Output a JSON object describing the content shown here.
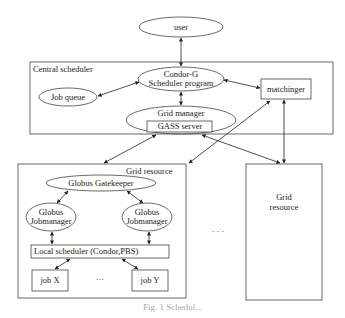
{
  "diagram": {
    "nodes": {
      "user": "user",
      "central_scheduler": "Central scheduler",
      "condor_g_line1": "Condor-G",
      "condor_g_line2": "Scheduler program",
      "job_queue": "Job queue",
      "matchinger": "matchinger",
      "grid_manager": "Grid manager",
      "gass_server": "GASS  server",
      "grid_resource_main": "Grid resource",
      "globus_gatekeeper": "Globus Gatekeeper",
      "jobmanager_left_line1": "Globus",
      "jobmanager_left_line2": "Jobmanager",
      "jobmanager_right_line1": "Globus",
      "jobmanager_right_line2": "Jobmanager",
      "local_scheduler": "Local scheduler (Condor,PBS)",
      "job_x": "job X",
      "job_y": "job Y",
      "job_ellipsis": "···",
      "grid_resource_other_line1": "Grid",
      "grid_resource_other_line2": "resource",
      "resources_ellipsis": "· · ·"
    },
    "edges": [
      {
        "from": "user",
        "to": "Condor-G Scheduler program",
        "type": "bidirectional"
      },
      {
        "from": "Job queue",
        "to": "Condor-G Scheduler program",
        "type": "bidirectional"
      },
      {
        "from": "Condor-G Scheduler program",
        "to": "matchinger",
        "type": "bidirectional"
      },
      {
        "from": "Condor-G Scheduler program",
        "to": "Grid manager",
        "type": "bidirectional"
      },
      {
        "from": "GASS server",
        "to": "Grid resource (left)",
        "type": "bidirectional"
      },
      {
        "from": "matchinger",
        "to": "Grid resource (left)",
        "type": "bidirectional"
      },
      {
        "from": "GASS server",
        "to": "Grid resource (right)",
        "type": "bidirectional"
      },
      {
        "from": "matchinger",
        "to": "Grid resource (right)",
        "type": "bidirectional"
      },
      {
        "from": "Globus Gatekeeper",
        "to": "Globus Jobmanager (left)",
        "type": "bidirectional"
      },
      {
        "from": "Globus Gatekeeper",
        "to": "Globus Jobmanager (right)",
        "type": "bidirectional"
      },
      {
        "from": "Globus Jobmanager (left)",
        "to": "Local scheduler",
        "type": "bidirectional"
      },
      {
        "from": "Globus Jobmanager (right)",
        "to": "Local scheduler",
        "type": "bidirectional"
      },
      {
        "from": "Local scheduler",
        "to": "job X",
        "type": "bidirectional"
      },
      {
        "from": "Local scheduler",
        "to": "job Y",
        "type": "bidirectional"
      }
    ],
    "caption": "Fig. 1 Schedul..."
  },
  "colors": {
    "stroke": "#333333",
    "background": "#ffffff",
    "text": "#222222"
  }
}
